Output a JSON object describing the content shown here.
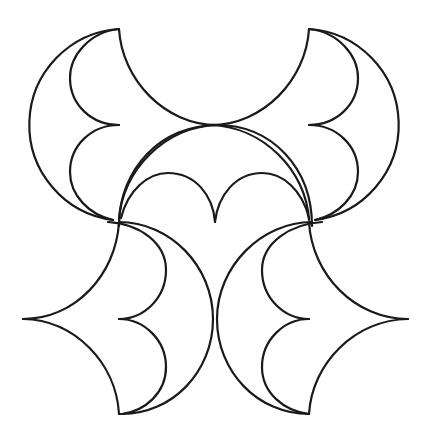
{
  "canvas": {
    "width": 434,
    "height": 438,
    "background": "#ffffff"
  },
  "style": {
    "stroke": "#1a1a1a",
    "stroke_width": 2.2
  },
  "figure": {
    "shapes": [
      {
        "name": "top-left-crescent"
      },
      {
        "name": "top-right-crescent"
      },
      {
        "name": "center-arch"
      },
      {
        "name": "center-heart-scallops"
      },
      {
        "name": "bottom-left-arrowhead"
      },
      {
        "name": "bottom-right-arrowhead"
      }
    ]
  }
}
